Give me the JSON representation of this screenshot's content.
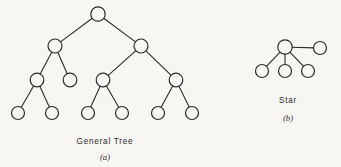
{
  "figure": {
    "background_color": "#f7f6f3",
    "stroke_color": "#2b2b2b",
    "node_fill": "#f7f6f3",
    "panels": [
      {
        "id": "general-tree",
        "caption_title": "General Tree",
        "caption_sub": "(a)",
        "caption_title_pos": {
          "x": 105,
          "y": 144
        },
        "caption_sub_pos": {
          "x": 105,
          "y": 160
        },
        "node_radius": 6.8,
        "nodes": [
          {
            "id": "n-root",
            "label": "",
            "x": 98,
            "y": 14,
            "r": 7.2,
            "level": 0
          },
          {
            "id": "n-l1a",
            "label": "",
            "x": 55,
            "y": 46,
            "r": 7.0,
            "level": 1
          },
          {
            "id": "n-l1b",
            "label": "",
            "x": 141,
            "y": 46,
            "r": 7.0,
            "level": 1
          },
          {
            "id": "n-l2a",
            "label": "",
            "x": 37,
            "y": 80,
            "r": 6.8,
            "level": 2
          },
          {
            "id": "n-l2b",
            "label": "",
            "x": 70,
            "y": 80,
            "r": 6.8,
            "level": 2
          },
          {
            "id": "n-l2c",
            "label": "",
            "x": 103,
            "y": 80,
            "r": 6.8,
            "level": 2
          },
          {
            "id": "n-l2d",
            "label": "",
            "x": 176,
            "y": 80,
            "r": 6.8,
            "level": 2
          },
          {
            "id": "n-l3a",
            "label": "",
            "x": 18,
            "y": 113,
            "r": 6.5,
            "level": 3
          },
          {
            "id": "n-l3b",
            "label": "",
            "x": 52,
            "y": 113,
            "r": 6.5,
            "level": 3
          },
          {
            "id": "n-l3c",
            "label": "",
            "x": 88,
            "y": 113,
            "r": 6.5,
            "level": 3
          },
          {
            "id": "n-l3d",
            "label": "",
            "x": 122,
            "y": 113,
            "r": 6.5,
            "level": 3
          },
          {
            "id": "n-l3e",
            "label": "",
            "x": 158,
            "y": 113,
            "r": 6.5,
            "level": 3
          },
          {
            "id": "n-l3f",
            "label": "",
            "x": 192,
            "y": 113,
            "r": 6.5,
            "level": 3
          }
        ],
        "edges": [
          {
            "from": "n-root",
            "to": "n-l1a"
          },
          {
            "from": "n-root",
            "to": "n-l1b"
          },
          {
            "from": "n-l1a",
            "to": "n-l2a"
          },
          {
            "from": "n-l1a",
            "to": "n-l2b"
          },
          {
            "from": "n-l1b",
            "to": "n-l2c"
          },
          {
            "from": "n-l1b",
            "to": "n-l2d"
          },
          {
            "from": "n-l2a",
            "to": "n-l3a"
          },
          {
            "from": "n-l2a",
            "to": "n-l3b"
          },
          {
            "from": "n-l2c",
            "to": "n-l3c"
          },
          {
            "from": "n-l2c",
            "to": "n-l3d"
          },
          {
            "from": "n-l2d",
            "to": "n-l3e"
          },
          {
            "from": "n-l2d",
            "to": "n-l3f"
          }
        ]
      },
      {
        "id": "star",
        "caption_title": "Star",
        "caption_sub": "(b)",
        "caption_title_pos": {
          "x": 288,
          "y": 103
        },
        "caption_sub_pos": {
          "x": 288,
          "y": 121
        },
        "node_radius": 6.8,
        "nodes": [
          {
            "id": "s-hub",
            "label": "",
            "x": 285,
            "y": 47,
            "r": 7.2,
            "level": 0
          },
          {
            "id": "s-sat1",
            "label": "",
            "x": 262,
            "y": 71,
            "r": 6.5,
            "level": 1
          },
          {
            "id": "s-sat2",
            "label": "",
            "x": 285,
            "y": 71,
            "r": 6.5,
            "level": 1
          },
          {
            "id": "s-sat3",
            "label": "",
            "x": 308,
            "y": 71,
            "r": 6.5,
            "level": 1
          },
          {
            "id": "s-sat4",
            "label": "",
            "x": 320,
            "y": 48,
            "r": 6.5,
            "level": 1
          }
        ],
        "edges": [
          {
            "from": "s-hub",
            "to": "s-sat1"
          },
          {
            "from": "s-hub",
            "to": "s-sat2"
          },
          {
            "from": "s-hub",
            "to": "s-sat3"
          },
          {
            "from": "s-hub",
            "to": "s-sat4"
          }
        ]
      }
    ]
  }
}
